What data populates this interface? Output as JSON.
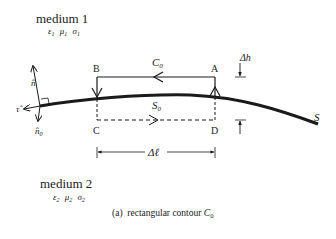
{
  "medium1": {
    "label": "medium 1",
    "params": [
      "ε",
      "μ",
      "σ"
    ],
    "subscript": "1"
  },
  "medium2": {
    "label": "medium 2",
    "params": [
      "ε",
      "μ",
      "σ"
    ],
    "subscript": "2"
  },
  "vectors": {
    "n_hat": "n̂",
    "tau_hat": "τ̂",
    "n0_hat": "n̂",
    "n0_sub": "0"
  },
  "contour": {
    "name": "C",
    "name_sub": "0",
    "corners": {
      "A": "A",
      "B": "B",
      "C": "C",
      "D": "D"
    },
    "surface_segment": "S",
    "surface_segment_sub": "0"
  },
  "surface": {
    "label": "S"
  },
  "dimensions": {
    "height": "Δh",
    "length": "Δℓ"
  },
  "caption": {
    "prefix": "(a)  rectangular contour ",
    "symbol": "C",
    "symbol_sub": "0"
  },
  "colors": {
    "line": "#1a1a1a",
    "text": "#222222",
    "background": "#ffffff"
  }
}
